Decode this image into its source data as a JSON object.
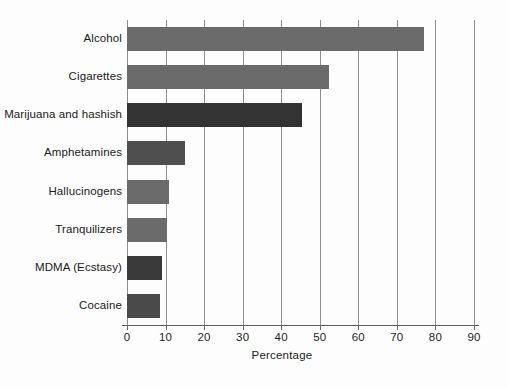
{
  "chart_data": {
    "type": "bar",
    "orientation": "horizontal",
    "title": "",
    "xlabel": "Percentage",
    "ylabel": "",
    "categories": [
      "Alcohol",
      "Cigarettes",
      "Marijuana and hashish",
      "Amphetamines",
      "Hallucinogens",
      "Tranquilizers",
      "MDMA (Ecstasy)",
      "Cocaine"
    ],
    "values": [
      77,
      52.5,
      45.5,
      15,
      11,
      10.5,
      9,
      8.5
    ],
    "bar_colors": [
      "#6b6b6b",
      "#6b6b6b",
      "#333333",
      "#4f4f4f",
      "#6b6b6b",
      "#6b6b6b",
      "#3a3a3a",
      "#4a4a4a"
    ],
    "xlim": [
      0,
      90
    ],
    "xticks": [
      0,
      10,
      20,
      30,
      40,
      50,
      60,
      70,
      80,
      90
    ],
    "xtick_labels": [
      "0",
      "10",
      "20",
      "30",
      "40",
      "50",
      "60",
      "70",
      "80",
      "90"
    ],
    "grid": true,
    "grid_axis": "x",
    "legend": false
  }
}
